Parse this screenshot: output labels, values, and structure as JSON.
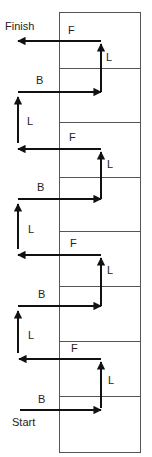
{
  "diagram": {
    "width": 152,
    "height": 457,
    "colors": {
      "arrow": "#111111",
      "box_line": "#555555",
      "text": "#222222"
    },
    "box": {
      "left": 59,
      "right": 140,
      "top": 12,
      "bottom": 452,
      "dividers": [
        68,
        122,
        177,
        231,
        286,
        341,
        396
      ]
    },
    "terminal_labels": {
      "finish": "Finish",
      "start": "Start"
    },
    "move_labels": {
      "forward": "F",
      "back": "B",
      "lateral": "L"
    },
    "arrow_x": {
      "left": 18,
      "right": 101
    },
    "cycles": [
      {
        "f_y": 41,
        "b_y": 92
      },
      {
        "f_y": 149,
        "b_y": 199
      },
      {
        "f_y": 255,
        "b_y": 306
      },
      {
        "f_y": 359,
        "b_y": 410
      }
    ],
    "sequence_bottom_to_top": [
      "B",
      "L",
      "F",
      "L",
      "B",
      "L",
      "F",
      "L",
      "B",
      "L",
      "F",
      "L",
      "B",
      "L",
      "F"
    ]
  },
  "labels": {
    "finish": "Finish",
    "start": "Start",
    "f1": "F",
    "f2": "F",
    "f3": "F",
    "f4": "F",
    "b1": "B",
    "b2": "B",
    "b3": "B",
    "b4": "B",
    "lr1": "L",
    "lr2": "L",
    "lr3": "L",
    "lr4": "L",
    "ll1": "L",
    "ll2": "L",
    "ll3": "L"
  }
}
